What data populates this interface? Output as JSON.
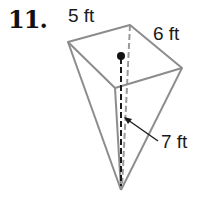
{
  "problem": {
    "number": "11."
  },
  "figure": {
    "type": "inverted-rectangular-pyramid",
    "labels": {
      "edge_front_left": "5 ft",
      "edge_back_right": "6 ft",
      "height": "7 ft"
    },
    "colors": {
      "edge": "#8c8c8c",
      "height_line": "#1a1a1a",
      "text": "#1a1a1a"
    }
  }
}
